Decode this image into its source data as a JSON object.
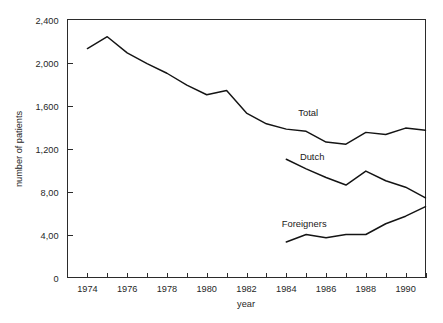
{
  "chart_data": {
    "type": "line",
    "title": "",
    "xlabel": "year",
    "ylabel": "number of patients",
    "xlim": [
      1973,
      1991
    ],
    "ylim": [
      0,
      2400
    ],
    "grid": false,
    "legend_position": "inline-labels",
    "y_ticks": [
      0,
      400,
      800,
      1200,
      1600,
      2000,
      2400
    ],
    "y_tick_labels": [
      "0",
      "4,00",
      "8,00",
      "1,200",
      "1,600",
      "2,000",
      "2,400"
    ],
    "x_ticks": [
      1973,
      1974,
      1975,
      1976,
      1977,
      1978,
      1979,
      1980,
      1981,
      1982,
      1983,
      1984,
      1985,
      1986,
      1987,
      1988,
      1989,
      1990,
      1991
    ],
    "x_tick_labels": [
      "1974",
      "1976",
      "1978",
      "1980",
      "1982",
      "1984",
      "1986",
      "1988",
      "1990"
    ],
    "x_labeled_ticks": [
      1974,
      1976,
      1978,
      1980,
      1982,
      1984,
      1986,
      1988,
      1990
    ],
    "series": [
      {
        "name": "Total",
        "label": "Total",
        "label_x": 1985.1,
        "label_y": 1530,
        "x": [
          1974,
          1975,
          1976,
          1977,
          1978,
          1979,
          1980,
          1981,
          1982,
          1983,
          1984,
          1985,
          1986,
          1987,
          1988,
          1989,
          1990,
          1991
        ],
        "values": [
          2130,
          2240,
          2090,
          1990,
          1900,
          1790,
          1700,
          1740,
          1530,
          1430,
          1380,
          1360,
          1260,
          1240,
          1350,
          1330,
          1390,
          1370
        ]
      },
      {
        "name": "Dutch",
        "label": "Dutch",
        "label_x": 1985.3,
        "label_y": 1120,
        "x": [
          1984,
          1985,
          1986,
          1987,
          1988,
          1989,
          1990,
          1991
        ],
        "values": [
          1100,
          1010,
          930,
          860,
          990,
          900,
          840,
          740
        ]
      },
      {
        "name": "Foreigners",
        "label": "Foreigners",
        "label_x": 1984.9,
        "label_y": 505,
        "x": [
          1984,
          1985,
          1986,
          1987,
          1988,
          1989,
          1990,
          1991
        ],
        "values": [
          330,
          400,
          370,
          400,
          400,
          500,
          570,
          660
        ]
      }
    ]
  }
}
